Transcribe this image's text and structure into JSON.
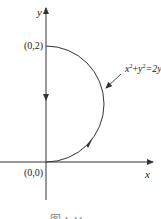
{
  "diagram": {
    "axes": {
      "x_label": "x",
      "y_label": "y"
    },
    "points": [
      {
        "label": "(0,2)",
        "x": 0,
        "y": 2
      },
      {
        "label": "(0,0)",
        "x": 0,
        "y": 0
      }
    ],
    "curve": {
      "equation_lhs_x": "x",
      "equation_lhs_y": "y",
      "exp": "2",
      "plus": "+",
      "rhs": "=2y",
      "description": "right half of circle x^2+y^2=2y, traversed counterclockwise from (0,0) to (0,2), then down the y-axis"
    },
    "caption": "图 1-11",
    "colors": {
      "stroke": "#333333",
      "background": "#ffffff"
    }
  }
}
